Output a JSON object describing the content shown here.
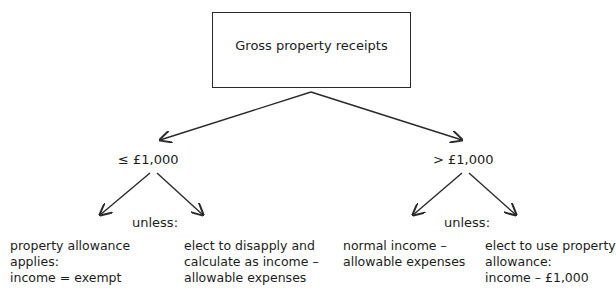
{
  "root": {
    "label": "Gross property receipts"
  },
  "branches": [
    {
      "condition": "≤ £1,000",
      "connector": "unless:",
      "outcomes": [
        {
          "text": "property allowance\napplies:\nincome = exempt"
        },
        {
          "text": "elect to disapply and\ncalculate as income –\nallowable expenses"
        }
      ]
    },
    {
      "condition": "> £1,000",
      "connector": "unless:",
      "outcomes": [
        {
          "text": "normal income –\nallowable expenses"
        },
        {
          "text": "elect to use property\nallowance:\nincome – £1,000"
        }
      ]
    }
  ],
  "colors": {
    "line": "#2a2a2a",
    "text": "#1c1c1c",
    "background": "#ffffff"
  }
}
